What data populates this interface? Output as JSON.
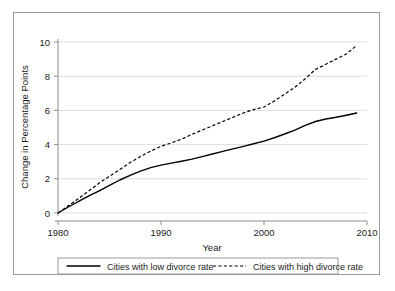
{
  "chart_data": {
    "type": "line",
    "title": "",
    "xlabel": "Year",
    "ylabel": "Change in Percentage Points",
    "xlim": [
      1980,
      2010
    ],
    "ylim": [
      0,
      10
    ],
    "xticks": [
      1980,
      1990,
      2000,
      2010
    ],
    "yticks": [
      0,
      2,
      4,
      6,
      8,
      10
    ],
    "grid": "horizontal",
    "legend_position": "below-axes",
    "x": [
      1980,
      1981,
      1982,
      1983,
      1984,
      1985,
      1986,
      1987,
      1988,
      1989,
      1990,
      1991,
      1992,
      1993,
      1994,
      1995,
      1996,
      1997,
      1998,
      1999,
      2000,
      2001,
      2002,
      2003,
      2004,
      2005,
      2006,
      2007,
      2008,
      2009
    ],
    "series": [
      {
        "name": "Cities with low divorce rate",
        "style": "solid",
        "color": "#000000",
        "values": [
          0,
          0.35,
          0.68,
          1.0,
          1.3,
          1.62,
          1.93,
          2.2,
          2.45,
          2.65,
          2.8,
          2.92,
          3.03,
          3.15,
          3.3,
          3.45,
          3.6,
          3.75,
          3.9,
          4.05,
          4.2,
          4.4,
          4.62,
          4.85,
          5.12,
          5.35,
          5.5,
          5.6,
          5.72,
          5.85
        ]
      },
      {
        "name": "Cities with high divorce rate",
        "style": "dashed",
        "color": "#000000",
        "values": [
          0,
          0.42,
          0.85,
          1.3,
          1.75,
          2.15,
          2.55,
          2.95,
          3.3,
          3.62,
          3.9,
          4.1,
          4.32,
          4.6,
          4.85,
          5.1,
          5.35,
          5.6,
          5.85,
          6.05,
          6.2,
          6.55,
          6.95,
          7.35,
          7.85,
          8.4,
          8.7,
          9.0,
          9.3,
          9.8
        ]
      }
    ]
  },
  "axis": {
    "ylabel": "Change in Percentage Points",
    "xlabel": "Year",
    "ytick_labels": [
      "0",
      "2",
      "4",
      "6",
      "8",
      "10"
    ],
    "xtick_labels": [
      "1980",
      "1990",
      "2000",
      "2010"
    ]
  },
  "legend": {
    "entries": [
      {
        "label": "Cities with low divorce rate",
        "style": "solid"
      },
      {
        "label": "Cities with high divorce rate",
        "style": "dashed"
      }
    ]
  },
  "colors": {
    "background": "#ffffff",
    "frame": "#9a9a9a",
    "gridline": "#d4d4d4",
    "axis": "#8c8c8c",
    "series": "#000000"
  }
}
